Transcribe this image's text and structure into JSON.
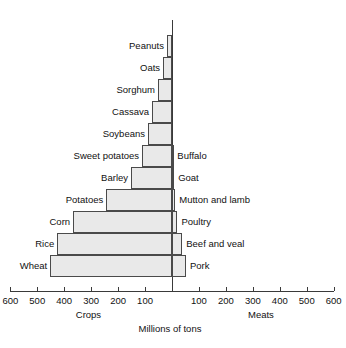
{
  "chart_data": {
    "type": "bar",
    "subtype": "bidirectional-pyramid",
    "title": "",
    "xlabel": "Millions of tons",
    "ylabel": "",
    "left_axis_label": "Crops",
    "right_axis_label": "Meats",
    "xlim": [
      -600,
      600
    ],
    "tick_values_left": [
      600,
      500,
      400,
      300,
      200,
      100
    ],
    "tick_values_right": [
      100,
      200,
      300,
      400,
      500,
      600
    ],
    "tick_labels_left": [
      "600",
      "500",
      "400",
      "300",
      "200",
      "100"
    ],
    "tick_labels_right": [
      "100",
      "200",
      "300",
      "400",
      "500",
      "600"
    ],
    "grid": false,
    "legend": "none",
    "units": "Millions of tons",
    "rows": [
      {
        "left_label": "Peanuts",
        "left_value": 19,
        "right_label": "",
        "right_value": 0
      },
      {
        "left_label": "Oats",
        "left_value": 33,
        "right_label": "",
        "right_value": 0
      },
      {
        "left_label": "Sorghum",
        "left_value": 52,
        "right_label": "",
        "right_value": 0
      },
      {
        "left_label": "Cassava",
        "left_value": 74,
        "right_label": "",
        "right_value": 0
      },
      {
        "left_label": "Soybeans",
        "left_value": 89,
        "right_label": "",
        "right_value": 0
      },
      {
        "left_label": "Sweet potatoes",
        "left_value": 111,
        "right_label": "Buffalo",
        "right_value": 5
      },
      {
        "left_label": "Barley",
        "left_value": 152,
        "right_label": "Goat",
        "right_value": 8
      },
      {
        "left_label": "Potatoes",
        "left_value": 244,
        "right_label": "Mutton and lamb",
        "right_value": 12
      },
      {
        "left_label": "Corn",
        "left_value": 367,
        "right_label": "Poultry",
        "right_value": 20
      },
      {
        "left_label": "Rice",
        "left_value": 426,
        "right_label": "Beef and veal",
        "right_value": 38
      },
      {
        "left_label": "Wheat",
        "left_value": 452,
        "right_label": "Pork",
        "right_value": 52
      }
    ],
    "colors": {
      "bar_fill": "#e9e9e9",
      "bar_stroke": "#4a4a4a",
      "axis": "#3a3a3a",
      "text": "#111111",
      "background": "#ffffff"
    }
  }
}
